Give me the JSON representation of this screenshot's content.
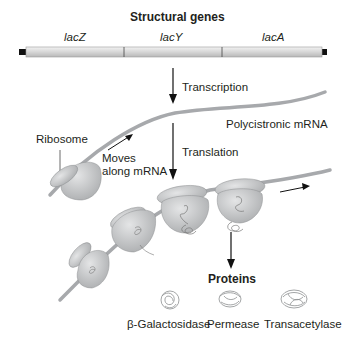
{
  "figure": {
    "title": "Structural genes",
    "genes": [
      {
        "name": "lacZ"
      },
      {
        "name": "lacY"
      },
      {
        "name": "lacA"
      }
    ],
    "steps": {
      "transcription": "Transcription",
      "translation": "Translation"
    },
    "labels": {
      "mrna": "Polycistronic mRNA",
      "ribosome": "Ribosome",
      "moves_line1": "Moves",
      "moves_line2": "along mRNA",
      "proteins": "Proteins"
    },
    "proteins": [
      {
        "name": "β-Galactosidase"
      },
      {
        "name": "Permease"
      },
      {
        "name": "Transacetylase"
      }
    ],
    "colors": {
      "gene_bar": "#d9d9d9",
      "mrna": "#a7a9ac",
      "ribosome": "#c8c9cb",
      "text": "#231f20"
    }
  }
}
